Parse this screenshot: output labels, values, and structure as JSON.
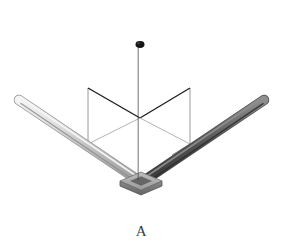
{
  "figure": {
    "caption": "A",
    "background_color": "#ffffff",
    "elements": {
      "vertical_rod": {
        "name": "vertical-rod",
        "color": "#0d0d0d",
        "highlight_color": "#4a4a4a",
        "top_x": 140,
        "top_y": 40,
        "bottom_x": 140,
        "bottom_y": 182,
        "width": 9
      },
      "left_rod": {
        "name": "left-rod",
        "color": "#c9c9c9",
        "highlight_color": "#efefef",
        "shade_color": "#a5a5a5",
        "tip_x": 19,
        "tip_y": 100,
        "base_x": 134,
        "base_y": 180,
        "width": 9
      },
      "right_rod": {
        "name": "right-rod",
        "color": "#5a5a5a",
        "highlight_color": "#8c8c8c",
        "shade_color": "#3a3a3a",
        "tip_x": 264,
        "tip_y": 100,
        "base_x": 148,
        "base_y": 180,
        "width": 9
      },
      "base_plate": {
        "name": "base-plate",
        "top_color": "#aeaeae",
        "side_color": "#7d7d7d",
        "edge_color": "#606060",
        "center_x": 141,
        "center_y": 181,
        "half_width": 21,
        "half_height": 9,
        "thickness": 5
      },
      "wireframe": {
        "name": "coordinate-plane-wireframe",
        "line_color": "#9a9a9a",
        "dark_line_color": "#1a1a1a",
        "line_width": 1,
        "left_post_x": 88,
        "left_post_top_y": 88,
        "left_post_bottom_y": 144,
        "right_post_x": 190,
        "right_post_top_y": 88,
        "right_post_bottom_y": 144,
        "center_x": 140,
        "center_apex_y": 118
      }
    }
  }
}
